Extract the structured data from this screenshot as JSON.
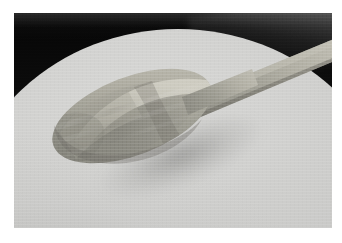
{
  "image": {
    "kind": "photograph",
    "title": "Wooden spoon resting on a bowl of pale batter",
    "rendering": "desaturated / near-grayscale",
    "canvas": {
      "width": 342,
      "height": 243
    },
    "mat": {
      "name": "white border",
      "color": "#ffffff",
      "inset_left": 14,
      "inset_top": 13,
      "inset_right": 10,
      "inset_bottom": 15
    },
    "photo": {
      "x": 14,
      "y": 13,
      "width": 318,
      "height": 215
    }
  },
  "scene": {
    "subjects": [
      {
        "name": "wooden-spoon",
        "description": "Light wooden spoon with a wide oval bowl, handle angling up to the upper right and passing over the dark bowl rim."
      },
      {
        "name": "batter-surface",
        "description": "Large pale cream-grey batter or mixture filling the bowl, occupying most of the frame."
      },
      {
        "name": "bowl-rim",
        "description": "Dark near-black mixing bowl rim curving across the top of the frame from upper left to right edge."
      },
      {
        "name": "cast-shadow",
        "description": "Soft grey shadow cast by the spoon bowl onto the batter below and to the left."
      }
    ]
  },
  "palette": {
    "mat_white": "#ffffff",
    "rim_black": "#0a0a0a",
    "rim_sheen_grey": "#6e6e6e",
    "batter_light": "#d6d6d4",
    "batter_mid": "#cbcbc9",
    "batter_dark": "#bcbcba",
    "spoon_light": "#b4b2a8",
    "spoon_mid": "#97968c",
    "spoon_dark": "#7b7a72",
    "spoon_edge": "#6a6962",
    "shadow_grey": "#8e8e8c"
  },
  "geometry": {
    "batter_ellipse": {
      "cx": 164,
      "cy": 181,
      "rx": 220,
      "ry": 165
    },
    "spoon_bowl": {
      "cx": 118,
      "cy": 103,
      "rx": 84,
      "ry": 39,
      "rotation_deg": -21
    },
    "spoon_handle": {
      "from_x": 176,
      "from_y": 86,
      "to_x": 322,
      "to_y": 34,
      "width": 17
    },
    "shadow_ellipse": {
      "cx": 167,
      "cy": 143,
      "rx": 89,
      "ry": 31,
      "rotation_deg": -21
    }
  }
}
